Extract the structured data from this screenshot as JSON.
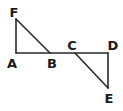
{
  "diagram": {
    "type": "geometry",
    "colors": {
      "line": "#2a2a2a",
      "label": "#1a1a1a",
      "background": "#ffffff"
    },
    "points": [
      {
        "id": "F",
        "label": "F",
        "x": 16,
        "y": 19,
        "lx": 14,
        "ly": 17
      },
      {
        "id": "A",
        "label": "A",
        "x": 16,
        "y": 53,
        "lx": 12,
        "ly": 68
      },
      {
        "id": "B",
        "label": "B",
        "x": 50,
        "y": 53,
        "lx": 52,
        "ly": 68
      },
      {
        "id": "C",
        "label": "C",
        "x": 75,
        "y": 53,
        "lx": 72,
        "ly": 50
      },
      {
        "id": "D",
        "label": "D",
        "x": 108,
        "y": 53,
        "lx": 113,
        "ly": 50
      },
      {
        "id": "E",
        "label": "E",
        "x": 108,
        "y": 88,
        "lx": 109,
        "ly": 103
      }
    ],
    "segments": [
      {
        "from": "A",
        "to": "F"
      },
      {
        "from": "F",
        "to": "B"
      },
      {
        "from": "A",
        "to": "D"
      },
      {
        "from": "C",
        "to": "E"
      },
      {
        "from": "D",
        "to": "E"
      }
    ],
    "triangles": [
      "AFB",
      "CDE"
    ]
  }
}
